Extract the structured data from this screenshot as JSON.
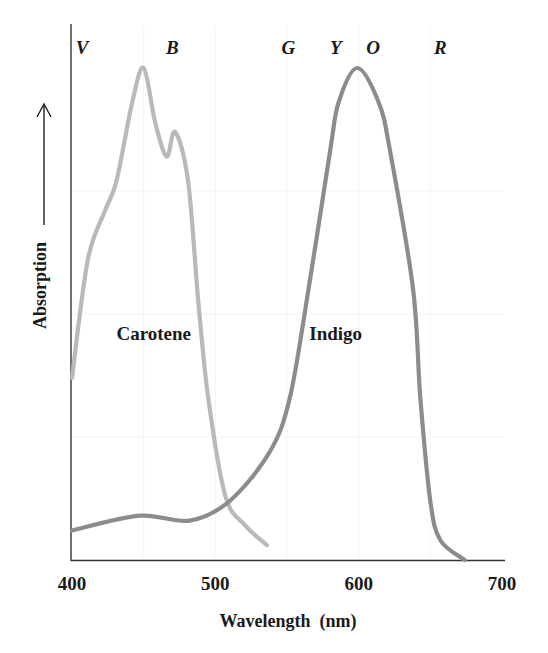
{
  "chart_data": {
    "type": "line",
    "title": "",
    "xlabel": "Wavelength  (nm)",
    "ylabel": "Absorption",
    "xlim": [
      400,
      700
    ],
    "ylim": [
      0,
      1
    ],
    "x_ticks": [
      400,
      500,
      600,
      700
    ],
    "grid": false,
    "legend": "inline labels",
    "color_bands": [
      {
        "label": "V",
        "x": 407
      },
      {
        "label": "B",
        "x": 470
      },
      {
        "label": "G",
        "x": 551
      },
      {
        "label": "Y",
        "x": 584
      },
      {
        "label": "O",
        "x": 610
      },
      {
        "label": "R",
        "x": 657
      }
    ],
    "series": [
      {
        "name": "Carotene",
        "color": "#b9b9b9",
        "label_pos": {
          "x": 457,
          "y": 0.46
        },
        "x": [
          400,
          411,
          423,
          431,
          442,
          450,
          458,
          466,
          472,
          481,
          488,
          495,
          507,
          521,
          536
        ],
        "values": [
          0.37,
          0.61,
          0.71,
          0.77,
          0.93,
          1.0,
          0.89,
          0.82,
          0.87,
          0.77,
          0.53,
          0.33,
          0.13,
          0.07,
          0.03
        ]
      },
      {
        "name": "Indigo",
        "color": "#8c8c8c",
        "label_pos": {
          "x": 584,
          "y": 0.46
        },
        "x": [
          400,
          447,
          482,
          510,
          538,
          552,
          565,
          580,
          586,
          599,
          614,
          622,
          638,
          643,
          650,
          657,
          674
        ],
        "values": [
          0.06,
          0.09,
          0.08,
          0.12,
          0.22,
          0.33,
          0.55,
          0.83,
          0.93,
          1.0,
          0.93,
          0.83,
          0.55,
          0.33,
          0.12,
          0.04,
          0.0
        ]
      }
    ]
  }
}
